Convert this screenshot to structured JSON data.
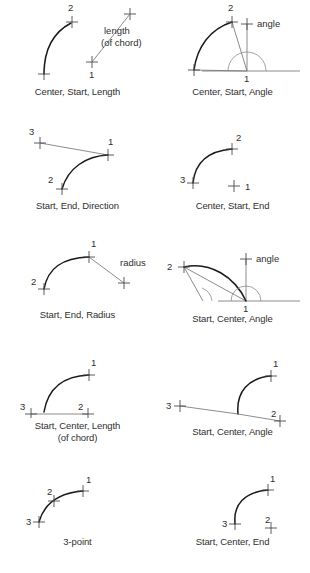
{
  "figure": {
    "background_color": "#ffffff",
    "arc_color": "#1a1a1a",
    "guide_color": "#6e6e6e",
    "mark_color": "#4a4a4a",
    "text_color": "#2f2f2f",
    "columns": 2,
    "rows": 5,
    "panel_count": 10
  },
  "panels": [
    {
      "id": "center-start-length",
      "caption_line1": "Center, Start, Length",
      "caption_line2": "",
      "point_labels": [
        "1",
        "2"
      ],
      "annotation_line1": "length",
      "annotation_line2": "(of chord)",
      "marks": 4
    },
    {
      "id": "center-start-angle",
      "caption_line1": "Center, Start, Angle",
      "caption_line2": "",
      "point_labels": [
        "1",
        "2"
      ],
      "annotation_line1": "angle",
      "annotation_line2": "",
      "marks": 3
    },
    {
      "id": "start-end-direction",
      "caption_line1": "Start, End, Direction",
      "caption_line2": "",
      "point_labels": [
        "1",
        "2",
        "3"
      ],
      "annotation_line1": "",
      "annotation_line2": "",
      "marks": 3
    },
    {
      "id": "center-start-end",
      "caption_line1": "Center, Start, End",
      "caption_line2": "",
      "point_labels": [
        "1",
        "2",
        "3"
      ],
      "annotation_line1": "",
      "annotation_line2": "",
      "marks": 3
    },
    {
      "id": "start-end-radius",
      "caption_line1": "Start, End, Radius",
      "caption_line2": "",
      "point_labels": [
        "1",
        "2"
      ],
      "annotation_line1": "radius",
      "annotation_line2": "",
      "marks": 3
    },
    {
      "id": "start-center-angle-upper",
      "caption_line1": "Start, Center, Angle",
      "caption_line2": "",
      "point_labels": [
        "1",
        "2"
      ],
      "annotation_line1": "angle",
      "annotation_line2": "",
      "marks": 3
    },
    {
      "id": "start-center-length",
      "caption_line1": "Start, Center, Length",
      "caption_line2": "(of chord)",
      "point_labels": [
        "1",
        "2",
        "3"
      ],
      "annotation_line1": "",
      "annotation_line2": "",
      "marks": 3
    },
    {
      "id": "start-center-angle-lower",
      "caption_line1": "Start, Center, Angle",
      "caption_line2": "",
      "point_labels": [
        "1",
        "2",
        "3"
      ],
      "annotation_line1": "",
      "annotation_line2": "",
      "marks": 3
    },
    {
      "id": "three-point",
      "caption_line1": "3-point",
      "caption_line2": "",
      "point_labels": [
        "1",
        "2",
        "3"
      ],
      "annotation_line1": "",
      "annotation_line2": "",
      "marks": 3
    },
    {
      "id": "start-center-end",
      "caption_line1": "Start, Center, End",
      "caption_line2": "",
      "point_labels": [
        "1",
        "2",
        "3"
      ],
      "annotation_line1": "",
      "annotation_line2": "",
      "marks": 3
    }
  ]
}
